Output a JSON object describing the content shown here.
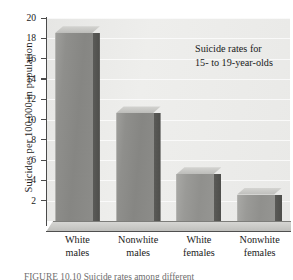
{
  "chart_data": {
    "type": "bar",
    "title": "Suicide rates for 15- to 19-year-olds",
    "title_lines": [
      "Suicide rates for",
      "15- to 19-year-olds"
    ],
    "xlabel": "",
    "ylabel": "Suicides per 100,000 in population",
    "categories": [
      "White males",
      "Nonwhite males",
      "White females",
      "Nonwhite females"
    ],
    "category_lines": [
      [
        "White",
        "males"
      ],
      [
        "Nonwhite",
        "males"
      ],
      [
        "White",
        "females"
      ],
      [
        "Nonwhite",
        "females"
      ]
    ],
    "values": [
      18.5,
      10.6,
      4.6,
      2.6
    ],
    "ylim": [
      0,
      20
    ],
    "ytick_step": 2,
    "yticks": [
      20,
      18,
      16,
      14,
      12,
      10,
      8,
      6,
      4,
      2
    ],
    "ytick_labels": [
      "20",
      "18",
      "16",
      "14",
      "12",
      "10",
      "8",
      "6",
      "4",
      "2"
    ],
    "grid": true,
    "grid_axis": "y",
    "legend": false,
    "style": "3d-bar",
    "colors": {
      "bar_face": "#8f8f8c",
      "bar_side": "#52524f",
      "bar_top": "#c8c8c5",
      "plot_background": "#ececeb",
      "gridline": "#ffffff",
      "axis": "#4a4a4a",
      "text": "#1a1a1a",
      "figure_background": "#ffffff"
    }
  },
  "caption": {
    "text": "FIGURE 10.10 Suicide rates among different"
  }
}
